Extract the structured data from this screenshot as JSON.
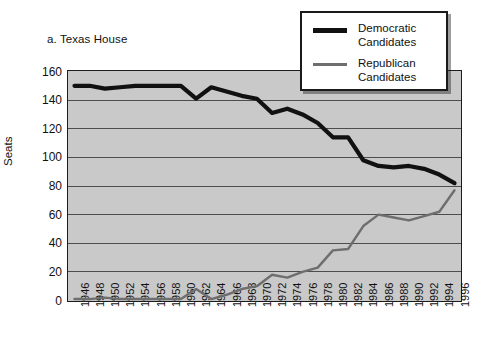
{
  "chart_data": {
    "type": "line",
    "title": "a. Texas House",
    "xlabel": "",
    "ylabel": "Seats",
    "ylim": [
      0,
      160
    ],
    "yticks": [
      0,
      20,
      40,
      60,
      80,
      100,
      120,
      140,
      160
    ],
    "grid": true,
    "legend_position": "top-right",
    "x": [
      1946,
      1948,
      1950,
      1952,
      1954,
      1956,
      1958,
      1960,
      1962,
      1964,
      1966,
      1968,
      1970,
      1972,
      1974,
      1976,
      1978,
      1980,
      1982,
      1984,
      1986,
      1988,
      1990,
      1992,
      1994,
      1996
    ],
    "categories": [
      "1946",
      "1948",
      "1950",
      "1952",
      "1954",
      "1956",
      "1958",
      "1960",
      "1962",
      "1964",
      "1966",
      "1968",
      "1970",
      "1972",
      "1974",
      "1976",
      "1978",
      "1980",
      "1982",
      "1984",
      "1986",
      "1988",
      "1990",
      "1992",
      "1994",
      "1996"
    ],
    "series": [
      {
        "name": "Democratic Candidates",
        "color": "#111111",
        "values": [
          150,
          150,
          148,
          149,
          150,
          150,
          150,
          150,
          141,
          149,
          146,
          143,
          141,
          131,
          134,
          130,
          124,
          114,
          114,
          98,
          94,
          93,
          94,
          92,
          88,
          82
        ]
      },
      {
        "name": "Republican Candidates",
        "color": "#6e6e6e",
        "values": [
          1,
          1,
          2,
          1,
          1,
          1,
          1,
          1,
          8,
          1,
          4,
          8,
          10,
          18,
          16,
          20,
          23,
          35,
          36,
          52,
          60,
          58,
          56,
          59,
          62,
          77
        ]
      }
    ]
  },
  "legend": {
    "entries": [
      {
        "label_line1": "Democratic",
        "label_line2": "Candidates",
        "swatch": "thick-black-line"
      },
      {
        "label_line1": "Republican",
        "label_line2": "Candidates",
        "swatch": "thin-gray-line"
      }
    ]
  },
  "colors": {
    "plot_background": "#c9c9c9",
    "gridline": "#4d4d4d",
    "axis": "#1c1c1c",
    "democratic": "#111111",
    "republican": "#6e6e6e",
    "page_background": "#ffffff"
  }
}
